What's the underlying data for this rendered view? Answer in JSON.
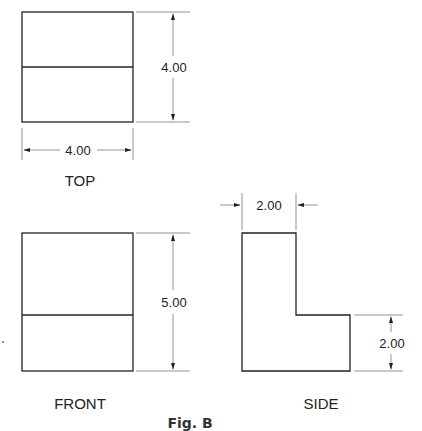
{
  "figure": {
    "caption": "Fig. B",
    "views": {
      "top": {
        "label": "TOP",
        "width_dim": "4.00",
        "depth_dim": "4.00"
      },
      "front": {
        "label": "FRONT",
        "height_dim": "5.00"
      },
      "side": {
        "label": "SIDE",
        "top_width_dim": "2.00",
        "step_height_dim": "2.00"
      }
    },
    "colors": {
      "line": "#222222",
      "background": "#ffffff"
    }
  }
}
